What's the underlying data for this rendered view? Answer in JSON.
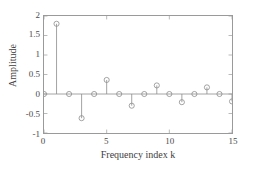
{
  "chart_data": {
    "type": "scatter",
    "plot_style": "stem",
    "title": "",
    "xlabel": "Frequency index k",
    "ylabel": "Amplitude",
    "xlim": [
      0,
      15
    ],
    "ylim": [
      -1,
      2
    ],
    "xticks": [
      0,
      5,
      10,
      15
    ],
    "xtick_labels": [
      "0",
      "5",
      "10",
      "15"
    ],
    "yticks": [
      2,
      1.5,
      1,
      0.5,
      0,
      -0.5,
      -1
    ],
    "ytick_labels": [
      "2",
      "1.5",
      "1",
      "0.5",
      "0",
      "-0.5",
      "-1"
    ],
    "grid": false,
    "legend": null,
    "marker": "circle-open",
    "x": [
      0,
      1,
      2,
      3,
      4,
      5,
      6,
      7,
      8,
      9,
      10,
      11,
      12,
      13,
      14,
      15
    ],
    "values": [
      0,
      1.8,
      0,
      -0.62,
      0,
      0.36,
      0,
      -0.3,
      0,
      0.22,
      0,
      -0.21,
      0,
      0.17,
      0,
      -0.19
    ],
    "baseline": 0,
    "colors": {
      "line": "#8c8c8c",
      "marker": "#8c8c8c",
      "axis": "#9a9a9a",
      "text": "#4a4a4a",
      "background": "#ffffff"
    }
  }
}
